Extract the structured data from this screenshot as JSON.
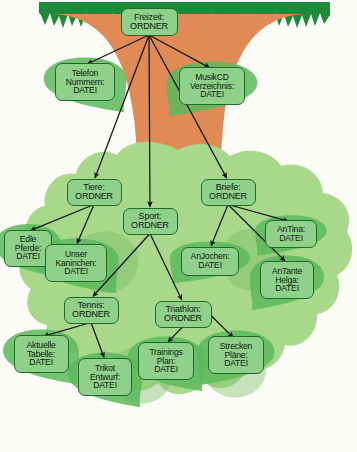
{
  "diagram": {
    "colors": {
      "canopy": "#a8d98a",
      "canopy_dark": "#7dbd6a",
      "trunk": "#e08b55",
      "grass": "#1d8a3a",
      "node_fill": "#8fd18a",
      "node_border": "#1d6b2a",
      "arrow": "#141414",
      "background": "#fbfbf7"
    },
    "node_kinds": {
      "folder": "ORDNER",
      "file": "DATEI"
    },
    "nodes": [
      {
        "id": "freizeit",
        "name": "Freizeit",
        "kind": "ORDNER",
        "label": "Freizeit:\nORDNER",
        "shape": "rounded-rect",
        "x": 149,
        "y": 22,
        "w": 57,
        "h": 28
      },
      {
        "id": "telefon_nummern",
        "name": "Telefon Nummern",
        "kind": "DATEI",
        "label": "Telefon\nNummern:\nDATEI",
        "shape": "leaf-left",
        "x": 85,
        "y": 82,
        "w": 60,
        "h": 38
      },
      {
        "id": "musikcd_verzeichnis",
        "name": "MusikCD Verzeichnis",
        "kind": "DATEI",
        "label": "MusikCD\nVerzeichnis:\nDATEI",
        "shape": "leaf-right",
        "x": 212,
        "y": 86,
        "w": 66,
        "h": 38
      },
      {
        "id": "tiere",
        "name": "Tiere",
        "kind": "ORDNER",
        "label": "Tiere:\nORDNER",
        "shape": "rounded-rect",
        "x": 94,
        "y": 192,
        "w": 55,
        "h": 27
      },
      {
        "id": "sport",
        "name": "Sport",
        "kind": "ORDNER",
        "label": "Sport:\nORDNER",
        "shape": "rounded-rect",
        "x": 150,
        "y": 221,
        "w": 55,
        "h": 27
      },
      {
        "id": "briefe",
        "name": "Briefe",
        "kind": "ORDNER",
        "label": "Briefe:\nORDNER",
        "shape": "rounded-rect",
        "x": 228,
        "y": 192,
        "w": 55,
        "h": 27
      },
      {
        "id": "edle_pferde",
        "name": "Edle Pferde",
        "kind": "DATEI",
        "label": "Edle\nPferde:\nDATEI",
        "shape": "leaf-left",
        "x": 28,
        "y": 248,
        "w": 48,
        "h": 37
      },
      {
        "id": "unser_kaninchen",
        "name": "Unser Kaninchen",
        "kind": "DATEI",
        "label": "Unser\nKaninchen:\nDATEI",
        "shape": "leaf-left",
        "x": 76,
        "y": 263,
        "w": 62,
        "h": 38
      },
      {
        "id": "anjochen",
        "name": "AnJochen",
        "kind": "DATEI",
        "label": "AnJochen:\nDATEI",
        "shape": "leaf-right",
        "x": 210,
        "y": 261,
        "w": 58,
        "h": 29
      },
      {
        "id": "antina",
        "name": "AnTina",
        "kind": "DATEI",
        "label": "AnTina:\nDATEI",
        "shape": "leaf-right",
        "x": 291,
        "y": 234,
        "w": 52,
        "h": 28
      },
      {
        "id": "antante_helga",
        "name": "AnTante Helga",
        "kind": "DATEI",
        "label": "AnTante\nHelga:\nDATEI",
        "shape": "leaf-right",
        "x": 287,
        "y": 280,
        "w": 54,
        "h": 38
      },
      {
        "id": "tennis",
        "name": "Tennis",
        "kind": "ORDNER",
        "label": "Tennis:\nORDNER",
        "shape": "rounded-rect",
        "x": 91,
        "y": 310,
        "w": 55,
        "h": 27
      },
      {
        "id": "triathlon",
        "name": "Triathlon",
        "kind": "ORDNER",
        "label": "Triathlon:\nORDNER",
        "shape": "rounded-rect",
        "x": 183,
        "y": 314,
        "w": 57,
        "h": 27
      },
      {
        "id": "aktuelle_tabelle",
        "name": "Aktuelle Tabelle",
        "kind": "DATEI",
        "label": "Aktuelle\nTabelle:\nDATEI",
        "shape": "leaf-left",
        "x": 41,
        "y": 354,
        "w": 55,
        "h": 38
      },
      {
        "id": "trikot_entwurf",
        "name": "Trikot Entwurf",
        "kind": "DATEI",
        "label": "Trikot\nEntwurf:\nDATEI",
        "shape": "leaf-left",
        "x": 105,
        "y": 377,
        "w": 54,
        "h": 38
      },
      {
        "id": "trainings_plan",
        "name": "Trainings Plan",
        "kind": "DATEI",
        "label": "Trainings\nPlan:\nDATEI",
        "shape": "leaf-left",
        "x": 166,
        "y": 361,
        "w": 56,
        "h": 38
      },
      {
        "id": "strecken_plaene",
        "name": "Strecken Pläne",
        "kind": "DATEI",
        "label": "Strecken\nPläne:\nDATEI",
        "shape": "leaf-right",
        "x": 236,
        "y": 355,
        "w": 56,
        "h": 38
      }
    ],
    "edges": [
      {
        "from": "freizeit",
        "to": "telefon_nummern"
      },
      {
        "from": "freizeit",
        "to": "musikcd_verzeichnis"
      },
      {
        "from": "freizeit",
        "to": "tiere"
      },
      {
        "from": "freizeit",
        "to": "sport"
      },
      {
        "from": "freizeit",
        "to": "briefe"
      },
      {
        "from": "tiere",
        "to": "edle_pferde"
      },
      {
        "from": "tiere",
        "to": "unser_kaninchen"
      },
      {
        "from": "sport",
        "to": "tennis"
      },
      {
        "from": "sport",
        "to": "triathlon"
      },
      {
        "from": "briefe",
        "to": "anjochen"
      },
      {
        "from": "briefe",
        "to": "antina"
      },
      {
        "from": "briefe",
        "to": "antante_helga"
      },
      {
        "from": "tennis",
        "to": "aktuelle_tabelle"
      },
      {
        "from": "tennis",
        "to": "trikot_entwurf"
      },
      {
        "from": "triathlon",
        "to": "trainings_plan"
      },
      {
        "from": "triathlon",
        "to": "strecken_plaene"
      }
    ]
  }
}
